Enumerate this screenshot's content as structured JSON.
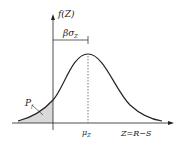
{
  "diagram": {
    "y_axis_label": "f(Z)",
    "x_axis_label": "Z=R−S",
    "bracket_label": "βσ",
    "bracket_sub": "Z",
    "mean_label": "μ",
    "mean_sub": "Z",
    "failure_label": "P",
    "failure_sub": "f"
  },
  "colors": {
    "line": "#222222",
    "shade": "#d9d9d9"
  }
}
